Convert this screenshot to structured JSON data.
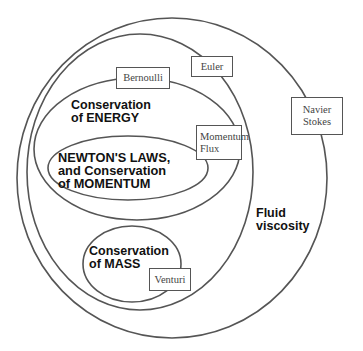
{
  "diagram": {
    "regions": {
      "energy": {
        "line1": "Conservation",
        "line2": "of ENERGY"
      },
      "newton": {
        "line1": "NEWTON'S LAWS,",
        "line2": "and Conservation",
        "line3": "of MOMENTUM"
      },
      "mass": {
        "line1": "Conservation",
        "line2": "of MASS"
      },
      "viscosity": {
        "line1": "Fluid",
        "line2": "viscosity"
      }
    },
    "boxes": {
      "bernoulli": {
        "label": "Bernoulli"
      },
      "euler": {
        "label": "Euler"
      },
      "momentum_flux": {
        "line1": "Momentum",
        "line2": "Flux"
      },
      "navier_stokes": {
        "line1": "Navier",
        "line2": "Stokes"
      },
      "venturi": {
        "label": "Venturi"
      }
    },
    "colors": {
      "stroke": "#555555",
      "text": "#111111",
      "box_text": "#444444",
      "background": "#ffffff"
    }
  }
}
